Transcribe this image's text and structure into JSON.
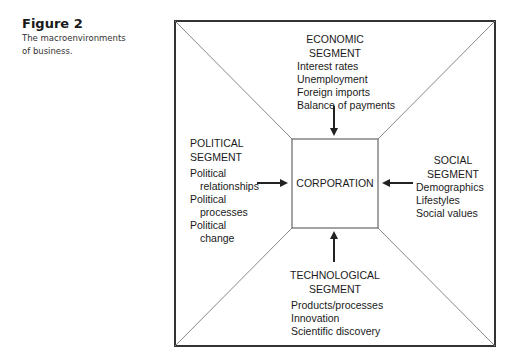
{
  "figure": {
    "number": "Figure 2",
    "caption_line1": "The macroenvironments",
    "caption_line2": "of business."
  },
  "diagram": {
    "center_label": "CORPORATION",
    "segments": {
      "economic": {
        "title_line1": "ECONOMIC",
        "title_line2": "SEGMENT",
        "items": [
          "Interest rates",
          "Unemployment",
          "Foreign imports",
          "Balance of payments"
        ]
      },
      "political": {
        "title_line1": "POLITICAL",
        "title_line2": "SEGMENT",
        "items": [
          "Political",
          "relationships",
          "Political",
          "processes",
          "Political",
          "change"
        ]
      },
      "social": {
        "title_line1": "SOCIAL",
        "title_line2": "SEGMENT",
        "items": [
          "Demographics",
          "Lifestyles",
          "Social values"
        ]
      },
      "technological": {
        "title_line1": "TECHNOLOGICAL",
        "title_line2": "SEGMENT",
        "items": [
          "Products/processes",
          "Innovation",
          "Scientific discovery"
        ]
      }
    },
    "colors": {
      "line": "#333333",
      "diagonal": "#888888",
      "text": "#1a1a1a"
    }
  }
}
